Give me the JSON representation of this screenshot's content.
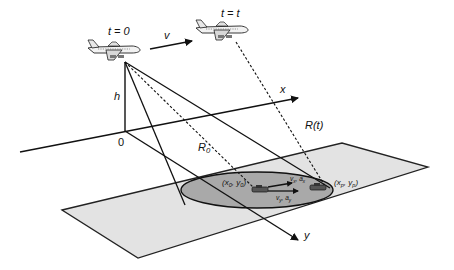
{
  "diagram": {
    "type": "sar-geometry",
    "colors": {
      "background": "#ffffff",
      "ground_plane": "#e3e3e3",
      "footprint": "#a9a9a9",
      "line": "#111111"
    },
    "aircraft": [
      {
        "id": "aircraft-t0",
        "label": "t = 0"
      },
      {
        "id": "aircraft-tt",
        "label": "t = t"
      }
    ],
    "labels": {
      "velocity": "v",
      "height": "h",
      "origin": "0",
      "x_axis": "x",
      "y_axis": "y",
      "slant_range_initial": "R",
      "slant_range_initial_sub": "0",
      "slant_range_time": "R(t)",
      "target_start": "(x",
      "target_start_sub": "0",
      "target_start_mid": ", y",
      "target_start_sub2": "0",
      "target_start_end": ")",
      "target_end": "(x",
      "target_end_sub": "p",
      "target_end_mid": ", y",
      "target_end_sub2": "p",
      "target_end_end": ")",
      "v_x": "v",
      "v_x_sub": "x",
      "a_x": ", a",
      "a_x_sub": "x",
      "v_y": "v",
      "v_y_sub": "y",
      "a_y": ", a",
      "a_y_sub": "y"
    }
  }
}
